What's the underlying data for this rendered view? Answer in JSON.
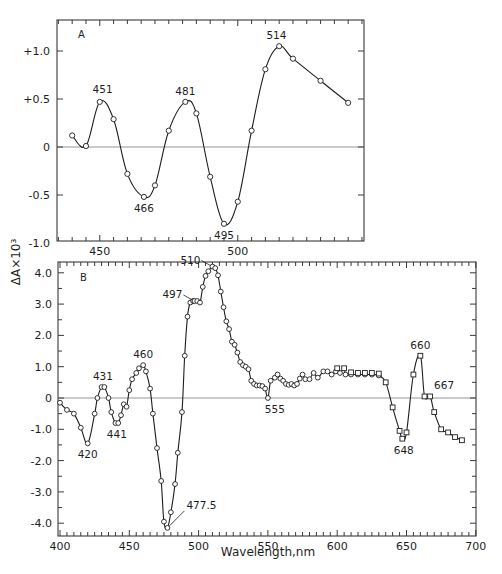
{
  "figure": {
    "ylabel": "ΔA×10³",
    "xlabel": "Wavelength,nm"
  },
  "chart_data": [
    {
      "type": "line",
      "panel": "A",
      "title": "",
      "xlabel": "",
      "ylabel": "ΔA×10³",
      "xlim": [
        434.5,
        545.5
      ],
      "ylim": [
        -1.0,
        1.3
      ],
      "xticks": [
        450,
        500
      ],
      "xtick_labels": [
        "450",
        "500"
      ],
      "yticks": [
        1.0,
        0.5,
        0,
        -0.5,
        -1.0
      ],
      "ytick_labels": [
        "+1.0",
        "+0.5",
        "0",
        "-0.5",
        "-1.0"
      ],
      "zero_line": true,
      "marker": "circle",
      "x": [
        440,
        445,
        450,
        455,
        460,
        466,
        470,
        475,
        481,
        485,
        490,
        495,
        500,
        505,
        510,
        515,
        520,
        530,
        540
      ],
      "y": [
        0.12,
        0.01,
        0.47,
        0.29,
        -0.28,
        -0.52,
        -0.4,
        0.17,
        0.47,
        0.35,
        -0.31,
        -0.8,
        -0.57,
        0.17,
        0.81,
        1.05,
        0.92,
        0.69,
        0.46
      ],
      "annotations": [
        {
          "text": "451",
          "x": 451,
          "y": 0.49,
          "pos": "above"
        },
        {
          "text": "466",
          "x": 466,
          "y": -0.52,
          "pos": "below"
        },
        {
          "text": "481",
          "x": 481,
          "y": 0.47,
          "pos": "above"
        },
        {
          "text": "495",
          "x": 495,
          "y": -0.8,
          "pos": "below"
        },
        {
          "text": "514",
          "x": 514,
          "y": 1.05,
          "pos": "above"
        }
      ]
    },
    {
      "type": "line",
      "panel": "B",
      "title": "",
      "xlabel": "Wavelength,nm",
      "ylabel": "ΔA×10³",
      "xlim": [
        398.5,
        700
      ],
      "ylim": [
        -4.4,
        4.35
      ],
      "xticks": [
        400,
        450,
        500,
        550,
        600,
        650,
        700
      ],
      "xtick_labels": [
        "400",
        "450",
        "500",
        "550",
        "600",
        "650",
        "700"
      ],
      "yticks": [
        4.0,
        3.0,
        2.0,
        1.0,
        0,
        -1.0,
        -2.0,
        -3.0,
        -4.0
      ],
      "ytick_labels": [
        "4.0",
        "3.0",
        "2.0",
        "1.0",
        "0",
        "-1.0",
        "-2.0",
        "-3.0",
        "-4.0"
      ],
      "zero_line": true,
      "series": [
        {
          "name": "circles (400–630 nm)",
          "marker": "circle",
          "x": [
            400,
            405,
            410,
            415,
            420,
            425,
            427,
            430,
            432,
            435,
            437,
            440,
            442,
            444,
            446,
            448,
            450,
            452,
            455,
            457,
            460,
            462,
            465,
            467,
            470,
            473,
            475,
            477.5,
            480,
            483,
            485,
            488,
            490,
            492,
            494,
            496,
            497,
            499,
            501,
            503,
            505,
            507,
            510,
            512,
            514,
            516,
            518,
            520,
            522,
            524,
            526,
            528,
            530,
            532,
            534,
            536,
            538,
            540,
            542,
            544,
            546,
            548,
            550,
            552,
            555,
            557,
            559,
            561,
            563,
            565,
            567,
            569,
            571,
            573,
            575,
            577,
            580,
            583,
            586,
            590,
            593,
            596,
            599,
            602,
            606,
            610,
            615,
            620,
            625,
            630
          ],
          "y": [
            -0.15,
            -0.38,
            -0.5,
            -0.95,
            -1.45,
            -0.5,
            0.0,
            0.35,
            0.35,
            0.0,
            -0.45,
            -0.8,
            -0.8,
            -0.55,
            -0.2,
            -0.28,
            0.25,
            0.6,
            0.8,
            0.95,
            1.05,
            0.85,
            0.3,
            -0.5,
            -1.6,
            -2.65,
            -3.95,
            -4.15,
            -3.65,
            -2.75,
            -1.75,
            -0.45,
            1.35,
            2.6,
            3.05,
            3.1,
            3.1,
            3.1,
            3.05,
            3.55,
            3.9,
            4.05,
            4.2,
            4.15,
            3.92,
            3.4,
            2.9,
            2.45,
            2.2,
            1.8,
            1.7,
            1.45,
            1.15,
            1.05,
            1.0,
            0.92,
            0.55,
            0.45,
            0.4,
            0.4,
            0.38,
            0.3,
            0.0,
            0.55,
            0.65,
            0.75,
            0.62,
            0.55,
            0.45,
            0.42,
            0.45,
            0.4,
            0.45,
            0.62,
            0.75,
            0.6,
            0.6,
            0.8,
            0.65,
            0.85,
            0.85,
            0.75,
            0.85,
            0.8,
            0.75,
            0.75,
            0.75,
            0.75,
            0.75,
            0.72
          ]
        },
        {
          "name": "squares (600–690 nm)",
          "marker": "square",
          "x": [
            600,
            605,
            610,
            615,
            620,
            625,
            630,
            635,
            640,
            645,
            647,
            650,
            655,
            660,
            663,
            667,
            670,
            675,
            680,
            685,
            690
          ],
          "y": [
            0.95,
            0.95,
            0.82,
            0.8,
            0.8,
            0.8,
            0.78,
            0.5,
            -0.3,
            -1.05,
            -1.3,
            -1.1,
            0.75,
            1.35,
            0.05,
            0.05,
            -0.45,
            -1.0,
            -1.1,
            -1.25,
            -1.35
          ]
        }
      ],
      "annotations": [
        {
          "text": "420",
          "x": 420,
          "y": -1.45,
          "pos": "below"
        },
        {
          "text": "431",
          "x": 431,
          "y": 0.35,
          "pos": "above"
        },
        {
          "text": "441",
          "x": 441,
          "y": -0.8,
          "pos": "below"
        },
        {
          "text": "460",
          "x": 460,
          "y": 1.05,
          "pos": "above"
        },
        {
          "text": "477.5",
          "x": 477.5,
          "y": -4.15,
          "pos": "leader-right"
        },
        {
          "text": "497",
          "x": 497,
          "y": 3.1,
          "pos": "leader-left"
        },
        {
          "text": "510",
          "x": 510,
          "y": 4.2,
          "pos": "leader-left"
        },
        {
          "text": "555",
          "x": 555,
          "y": 0.0,
          "pos": "below"
        },
        {
          "text": "648",
          "x": 648,
          "y": -1.3,
          "pos": "below"
        },
        {
          "text": "660",
          "x": 660,
          "y": 1.35,
          "pos": "above"
        },
        {
          "text": "667",
          "x": 667,
          "y": 0.05,
          "pos": "above-right"
        }
      ]
    }
  ]
}
